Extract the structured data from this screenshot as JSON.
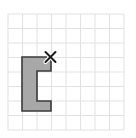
{
  "canvas": {
    "width": 136,
    "height": 138,
    "background": "#ffffff"
  },
  "grid": {
    "name": "coordinate-grid",
    "columns": 8,
    "rows": 8,
    "cell_size": 14.5,
    "origin_x": 8,
    "origin_y": 14,
    "line_color": "#e2e2e2",
    "line_width": 1,
    "visible": true
  },
  "shape": {
    "name": "c-shaped-polygon",
    "label": "C",
    "fill_color": "#a8a8a8",
    "stroke_color": "#3a3a3a",
    "stroke_width": 1.6,
    "grid_cells_wide": 2,
    "grid_cells_tall": 3.75,
    "vertices_px": [
      [
        22,
        57
      ],
      [
        51,
        57
      ],
      [
        51,
        71
      ],
      [
        37,
        71
      ],
      [
        37,
        101
      ],
      [
        51,
        101
      ],
      [
        51,
        111
      ],
      [
        22,
        111
      ]
    ],
    "vertices_grid": [
      [
        1,
        3
      ],
      [
        3,
        3
      ],
      [
        3,
        4
      ],
      [
        2,
        4
      ],
      [
        2,
        6
      ],
      [
        3,
        6
      ],
      [
        3,
        6.7
      ],
      [
        1,
        6.7
      ]
    ]
  },
  "marker": {
    "name": "vertex-x-marker",
    "symbol": "x",
    "x_px": 50.5,
    "y_px": 57,
    "arm_length": 5.0,
    "color": "#1a1a1a",
    "stroke_width": 2.0,
    "highlight_color": "#ffffff",
    "description": "X marks the top-right corner vertex of the shape"
  },
  "chart_data": {
    "type": "scatter",
    "title": "",
    "xlabel": "",
    "ylabel": "",
    "xlim": [
      0,
      8
    ],
    "ylim": [
      0,
      8
    ],
    "grid": true,
    "legend": false,
    "annotations": [
      {
        "label": "x",
        "x": 3,
        "y": 3
      }
    ]
  }
}
